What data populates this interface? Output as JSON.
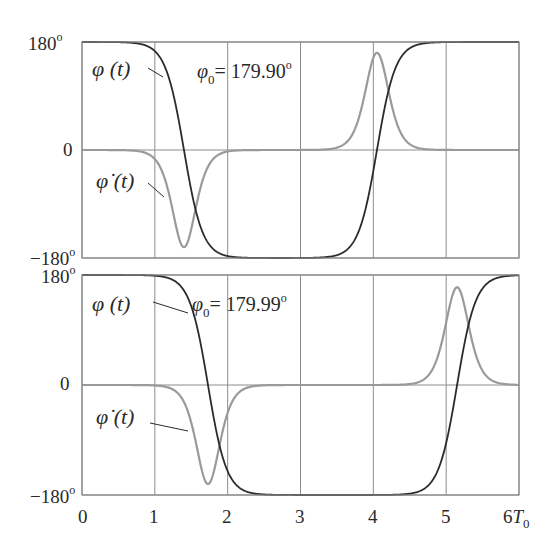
{
  "figure": {
    "x_ticks": [
      "0",
      "1",
      "2",
      "3",
      "4",
      "5",
      "6"
    ],
    "x_unit_label": "T",
    "x_unit_subscript": "0",
    "y_ticks": [
      "180",
      "0",
      "−180"
    ],
    "degree_mark": "o",
    "curve_labels": {
      "phi": "φ (t)",
      "phi_dot": "φ̇ (t)"
    },
    "colors": {
      "phi": "#2b2b2b",
      "phi_dot": "#9a9a9a",
      "grid": "#8c8c8c",
      "frame": "#8c8c8c"
    }
  },
  "chart_data": [
    {
      "type": "line",
      "title": "φ₀= 179.90°",
      "annotation": "φ₀= 179.90",
      "xlabel": "t (T₀)",
      "ylabel": "",
      "xlim": [
        0,
        6
      ],
      "ylim": [
        -180,
        180
      ],
      "grid": true,
      "x_ticks": [
        0,
        1,
        2,
        3,
        4,
        5,
        6
      ],
      "y_ticks": [
        -180,
        0,
        180
      ],
      "params": {
        "fall_center": 1.4,
        "rise_center": 4.05,
        "width": 0.16,
        "dip_value": -162,
        "peak_value": 162
      },
      "series": [
        {
          "name": "φ(t)",
          "x": [
            0,
            0.5,
            1.0,
            1.2,
            1.4,
            1.6,
            1.8,
            2.0,
            2.5,
            3.0,
            3.5,
            3.8,
            4.05,
            4.3,
            4.6,
            5.0,
            6.0
          ],
          "values": [
            180,
            179,
            168,
            135,
            0,
            -135,
            -168,
            -177,
            -180,
            -180,
            -178,
            -150,
            0,
            150,
            176,
            180,
            180
          ]
        },
        {
          "name": "φ̇(t)",
          "x": [
            0,
            0.5,
            1.0,
            1.2,
            1.37,
            1.6,
            1.8,
            2.0,
            2.5,
            3.0,
            3.5,
            3.8,
            4.05,
            4.3,
            4.6,
            5.0,
            6.0
          ],
          "values": [
            0,
            -2,
            -20,
            -80,
            -162,
            -80,
            -25,
            -8,
            -1,
            0,
            3,
            40,
            162,
            40,
            5,
            0,
            -2
          ]
        }
      ]
    },
    {
      "type": "line",
      "title": "φ₀= 179.99°",
      "annotation": "φ₀= 179.99",
      "xlabel": "t (T₀)",
      "ylabel": "",
      "xlim": [
        0,
        6
      ],
      "ylim": [
        -180,
        180
      ],
      "grid": true,
      "x_ticks": [
        0,
        1,
        2,
        3,
        4,
        5,
        6
      ],
      "y_ticks": [
        -180,
        0,
        180
      ],
      "params": {
        "fall_center": 1.73,
        "rise_center": 5.15,
        "width": 0.16,
        "dip_value": -162,
        "peak_value": 160
      },
      "series": [
        {
          "name": "φ(t)",
          "x": [
            0,
            0.5,
            1.0,
            1.3,
            1.5,
            1.73,
            2.0,
            2.3,
            2.5,
            3.0,
            4.0,
            4.5,
            4.9,
            5.15,
            5.4,
            5.7,
            6.0
          ],
          "values": [
            180,
            180,
            178,
            166,
            130,
            0,
            -140,
            -174,
            -178,
            -180,
            -180,
            -178,
            -140,
            0,
            140,
            172,
            178
          ]
        },
        {
          "name": "φ̇(t)",
          "x": [
            0,
            0.5,
            1.0,
            1.3,
            1.5,
            1.73,
            1.9,
            2.1,
            2.5,
            3.0,
            4.0,
            4.5,
            4.9,
            5.15,
            5.4,
            5.7,
            6.0
          ],
          "values": [
            0,
            0,
            -3,
            -25,
            -80,
            -162,
            -95,
            -30,
            -4,
            0,
            0,
            4,
            70,
            160,
            70,
            12,
            0
          ]
        }
      ]
    }
  ]
}
